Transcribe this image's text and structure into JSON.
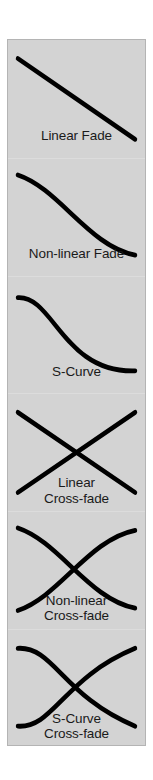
{
  "figure": {
    "background_color": "#d3d3d3",
    "border_color": "#b4b4b4",
    "curve_color": "#000000",
    "caption_color": "#1a1a1a",
    "panels": [
      {
        "name": "linear-fade",
        "caption_lines": [
          "Linear Fade"
        ],
        "curve_type": "line",
        "description": "straight line descending from upper-left to lower-right",
        "paths": [
          "M 10 16 L 129 86"
        ]
      },
      {
        "name": "non-linear-fade",
        "caption_lines": [
          "Non-linear Fade"
        ],
        "curve_type": "exponential-decay",
        "description": "convex curve falling steeply then flattening toward the right",
        "paths": [
          "M 10 14 C 52 26, 82 76, 129 84"
        ]
      },
      {
        "name": "s-curve",
        "caption_lines": [
          "S-Curve"
        ],
        "curve_type": "sigmoid",
        "description": "flat at left, steep descent through the middle, flat at right",
        "paths": [
          "M 10 18 C 46 16, 56 84, 129 82"
        ]
      },
      {
        "name": "linear-cross-fade",
        "caption_lines": [
          "Linear",
          "Cross-fade"
        ],
        "curve_type": "line-pair",
        "description": "two straight lines crossing at the center forming an X",
        "paths": [
          "M 10 16 L 129 86",
          "M 10 86 L 129 16"
        ]
      },
      {
        "name": "non-linear-cross-fade",
        "caption_lines": [
          "Non-linear",
          "Cross-fade"
        ],
        "curve_type": "exponential-pair",
        "description": "two exponential curves crossing left of center, one falling and one rising",
        "paths": [
          "M 10 14 C 52 26, 82 76, 129 84",
          "M 10 86 C 52 74, 82 24, 129 16"
        ]
      },
      {
        "name": "s-curve-cross-fade",
        "caption_lines": [
          "S-Curve",
          "Cross-fade"
        ],
        "curve_type": "sigmoid-pair",
        "description": "two sigmoid curves meeting and crossing at the center",
        "paths": [
          "M 10 16 C 46 14, 56 58, 129 84",
          "M 10 84 C 46 86, 56 42, 129 16"
        ]
      }
    ]
  }
}
